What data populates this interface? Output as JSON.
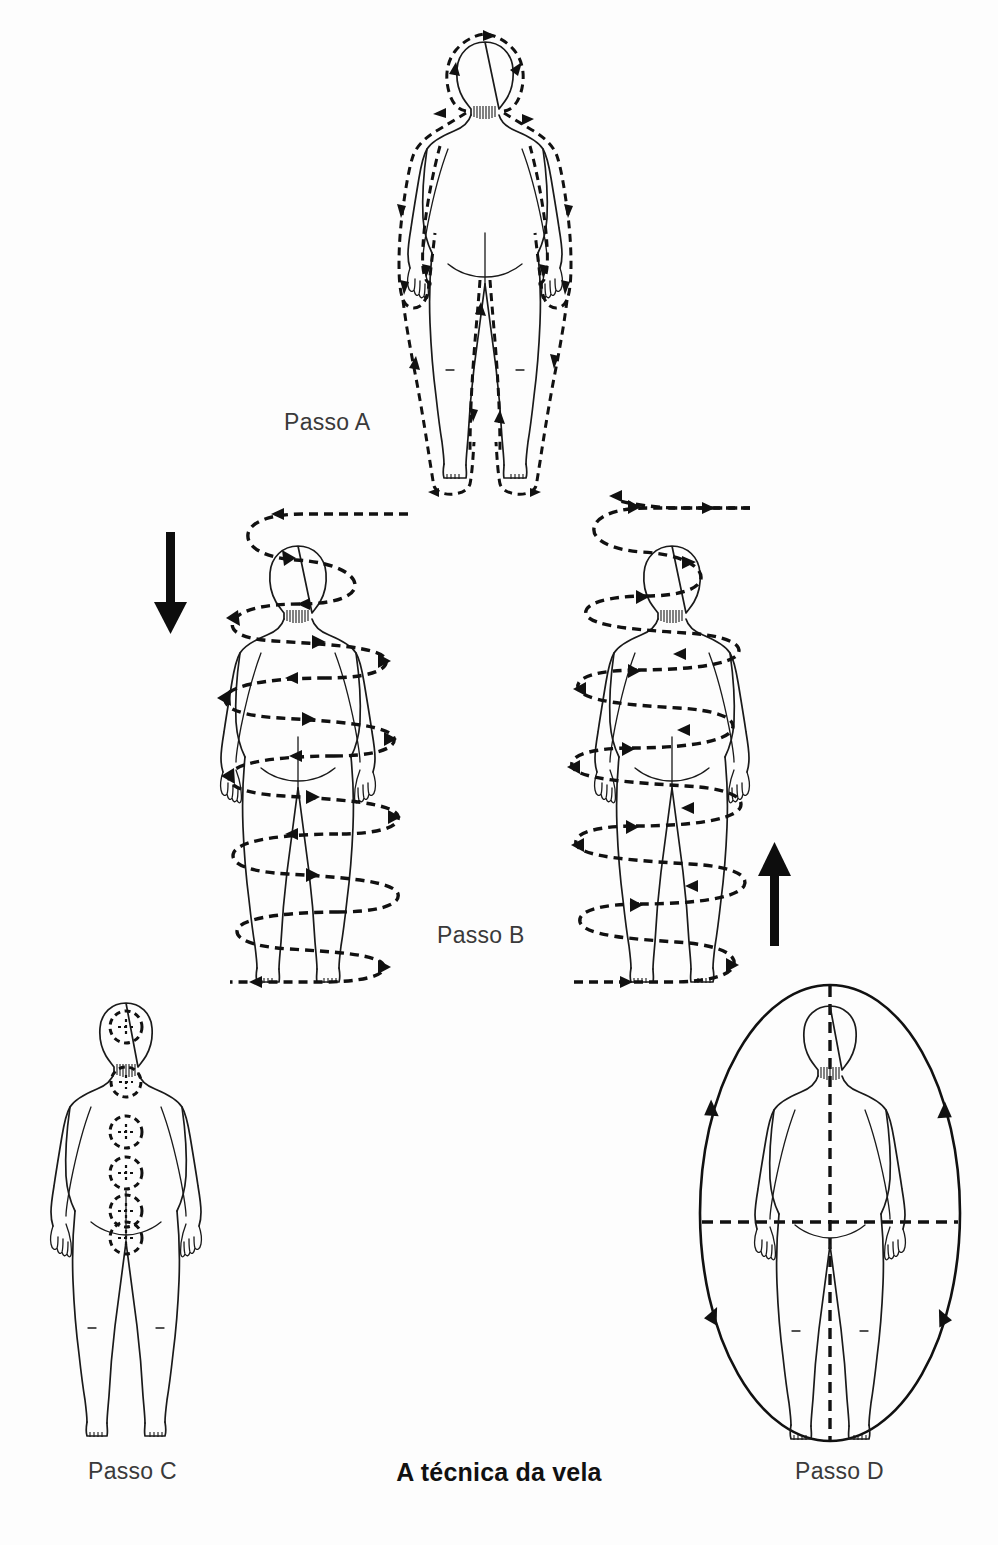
{
  "page": {
    "width": 998,
    "height": 1545,
    "background_color": "#fdfdfd",
    "ink_color": "#111111",
    "label_color": "#3a3a3a"
  },
  "title": {
    "text": "A técnica da vela",
    "style": "bold",
    "position": "bottom-center"
  },
  "figures": [
    {
      "id": "passo-a",
      "label": "Passo A",
      "label_position": "left-of-figure",
      "view": "posterior full body standing",
      "flow_type": "dashed-outline-contour",
      "description": "Dashed contour line traced around the whole body silhouette, descending on the outer edges and ascending on the inner edges",
      "arrow_count": 18,
      "arrow_directions": [
        "down-outer-left",
        "down-outer-right",
        "up-inner-left",
        "up-inner-right",
        "over-head"
      ]
    },
    {
      "id": "passo-b-left",
      "label": "Passo B",
      "view": "posterior full body standing",
      "flow_type": "descending-helix",
      "direction": "downward",
      "bold_arrow": "down",
      "bold_arrow_side": "left",
      "coil_count": 6,
      "description": "Dashed spiral coiling downward around the body from above the head to below the feet"
    },
    {
      "id": "passo-b-right",
      "label": "Passo B",
      "view": "posterior full body standing",
      "flow_type": "ascending-helix",
      "direction": "upward",
      "bold_arrow": "up",
      "bold_arrow_side": "right",
      "coil_count": 6,
      "description": "Dashed spiral coiling upward around the body from below the feet to above the head"
    },
    {
      "id": "passo-c",
      "label": "Passo C",
      "label_position": "below-figure",
      "view": "posterior full body standing",
      "flow_type": "chakra-points",
      "point_count": 6,
      "point_names": [
        "crown",
        "neck",
        "upper-back",
        "mid-back",
        "lower-back",
        "sacrum"
      ],
      "description": "Six dashed circles marked along the midline of the back from head to sacrum"
    },
    {
      "id": "passo-d",
      "label": "Passo D",
      "label_position": "below-figure",
      "view": "posterior full body standing",
      "flow_type": "surrounding-ellipse",
      "ellipse_arrows": 4,
      "ellipse_arrow_direction": "upward on both sides",
      "axes": [
        "vertical-dashed-midline",
        "horizontal-dashed-at-hips"
      ],
      "description": "Solid ellipse enclosing the body with four arrowheads, crossed by dashed vertical and horizontal axis lines"
    }
  ],
  "labels": {
    "passo_a": "Passo A",
    "passo_b": "Passo B",
    "passo_c": "Passo C",
    "passo_d": "Passo D"
  }
}
